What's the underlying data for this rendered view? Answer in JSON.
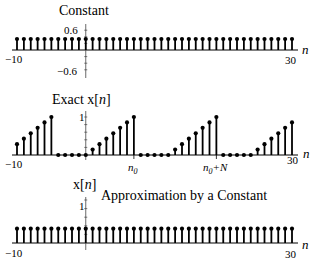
{
  "chart_data": [
    {
      "type": "stem",
      "title": "Constant",
      "xlabel": "n",
      "ylabel": "",
      "x_range": [
        -10,
        30
      ],
      "ylim": [
        -0.6,
        0.6
      ],
      "ytick_labels": [
        "0.6",
        "−0.6"
      ],
      "xtick_labels": [
        "−10",
        "30"
      ],
      "x": [
        -10,
        -9,
        -8,
        -7,
        -6,
        -5,
        -4,
        -3,
        -2,
        -1,
        0,
        1,
        2,
        3,
        4,
        5,
        6,
        7,
        8,
        9,
        10,
        11,
        12,
        13,
        14,
        15,
        16,
        17,
        18,
        19,
        20,
        21,
        22,
        23,
        24,
        25,
        26,
        27,
        28,
        29,
        30
      ],
      "values": [
        0.333,
        0.333,
        0.333,
        0.333,
        0.333,
        0.333,
        0.333,
        0.333,
        0.333,
        0.333,
        0.333,
        0.333,
        0.333,
        0.333,
        0.333,
        0.333,
        0.333,
        0.333,
        0.333,
        0.333,
        0.333,
        0.333,
        0.333,
        0.333,
        0.333,
        0.333,
        0.333,
        0.333,
        0.333,
        0.333,
        0.333,
        0.333,
        0.333,
        0.333,
        0.333,
        0.333,
        0.333,
        0.333,
        0.333,
        0.333,
        0.333
      ]
    },
    {
      "type": "stem",
      "title": "Exact x[n]",
      "xlabel": "n",
      "ylabel": "",
      "x_range": [
        -10,
        30
      ],
      "ylim": [
        0,
        1
      ],
      "ytick_labels": [
        "1"
      ],
      "xtick_labels": [
        "−10",
        "n0",
        "n0+N",
        "30"
      ],
      "annotations": {
        "n0": 7,
        "n0+N": 19,
        "N": 12
      },
      "x": [
        -10,
        -9,
        -8,
        -7,
        -6,
        -5,
        -4,
        -3,
        -2,
        -1,
        0,
        1,
        2,
        3,
        4,
        5,
        6,
        7,
        8,
        9,
        10,
        11,
        12,
        13,
        14,
        15,
        16,
        17,
        18,
        19,
        20,
        21,
        22,
        23,
        24,
        25,
        26,
        27,
        28,
        29,
        30
      ],
      "values": [
        0.286,
        0.429,
        0.571,
        0.714,
        0.857,
        1.0,
        0,
        0,
        0,
        0,
        0,
        0.143,
        0.286,
        0.429,
        0.571,
        0.714,
        0.857,
        1.0,
        0,
        0,
        0,
        0,
        0,
        0.143,
        0.286,
        0.429,
        0.571,
        0.714,
        0.857,
        1.0,
        0,
        0,
        0,
        0,
        0,
        0.143,
        0.286,
        0.429,
        0.571,
        0.714,
        0.857
      ]
    },
    {
      "type": "stem",
      "title": "Approximation by a Constant",
      "xlabel": "n",
      "ylabel": "x[n]",
      "x_range": [
        -10,
        30
      ],
      "ylim": [
        0,
        1
      ],
      "ytick_labels": [
        "1"
      ],
      "xtick_labels": [
        "−10",
        "30"
      ],
      "x": [
        -10,
        -9,
        -8,
        -7,
        -6,
        -5,
        -4,
        -3,
        -2,
        -1,
        0,
        1,
        2,
        3,
        4,
        5,
        6,
        7,
        8,
        9,
        10,
        11,
        12,
        13,
        14,
        15,
        16,
        17,
        18,
        19,
        20,
        21,
        22,
        23,
        24,
        25,
        26,
        27,
        28,
        29,
        30
      ],
      "values": [
        0.333,
        0.333,
        0.333,
        0.333,
        0.333,
        0.333,
        0.333,
        0.333,
        0.333,
        0.333,
        0.333,
        0.333,
        0.333,
        0.333,
        0.333,
        0.333,
        0.333,
        0.333,
        0.333,
        0.333,
        0.333,
        0.333,
        0.333,
        0.333,
        0.333,
        0.333,
        0.333,
        0.333,
        0.333,
        0.333,
        0.333,
        0.333,
        0.333,
        0.333,
        0.333,
        0.333,
        0.333,
        0.333,
        0.333,
        0.333,
        0.333
      ]
    }
  ],
  "labels": {
    "top_title": "Constant",
    "top_ytick_pos": "0.6",
    "top_ytick_neg": "−0.6",
    "mid_title": "Exact x[",
    "mid_title_var": "n",
    "mid_title_end": "]",
    "mid_ytick": "1",
    "bot_ylabel": "x[",
    "bot_ylabel_var": "n",
    "bot_ylabel_end": "]",
    "bot_title": "Approximation by a Constant",
    "bot_ytick": "1",
    "x_min": "−10",
    "x_max": "30",
    "axis_var": "n",
    "n0_base": "n",
    "n0_sub": "0",
    "n0N_suffix": "+N"
  }
}
